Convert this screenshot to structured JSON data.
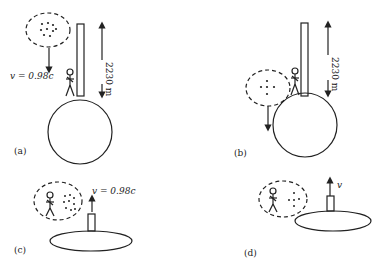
{
  "figure": {
    "panels": [
      {
        "id": "a",
        "label": "(a)",
        "velocity_label": "v = 0.98c",
        "height_label": "2230 m"
      },
      {
        "id": "b",
        "label": "(b)",
        "height_label": "2230 m"
      },
      {
        "id": "c",
        "label": "(c)",
        "velocity_label": "v = 0.98c"
      },
      {
        "id": "d",
        "label": "(d)",
        "velocity_label": "v"
      }
    ]
  },
  "colors": {
    "stroke": "#222222",
    "background": "#ffffff"
  }
}
